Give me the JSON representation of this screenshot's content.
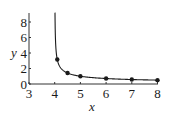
{
  "chart_data": {
    "type": "line",
    "title": "",
    "xlabel": "x",
    "ylabel": "y",
    "xlim": [
      3,
      8
    ],
    "ylim": [
      0,
      9
    ],
    "x_ticks": [
      3,
      4,
      5,
      6,
      7,
      8
    ],
    "y_ticks": [
      0,
      2,
      4,
      6,
      8
    ],
    "grid": false,
    "legend": null,
    "series": [
      {
        "name": "curve",
        "kind": "line",
        "function": "y = 1/sqrt(x-4)",
        "x_start": 4.012,
        "x_end": 8,
        "color": "#1a1a1a"
      },
      {
        "name": "points",
        "kind": "scatter",
        "x": [
          4.1,
          4.5,
          5,
          6,
          7,
          8
        ],
        "y": [
          3.16,
          1.41,
          1.0,
          0.71,
          0.58,
          0.5
        ],
        "color": "#1a1a1a"
      }
    ]
  },
  "labels": {
    "x_axis": "x",
    "y_axis": "y",
    "x_ticks": [
      "3",
      "4",
      "5",
      "6",
      "7",
      "8"
    ],
    "y_ticks": [
      "0",
      "2",
      "4",
      "6",
      "8"
    ]
  }
}
